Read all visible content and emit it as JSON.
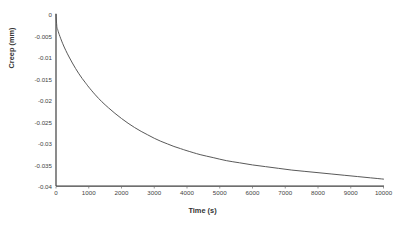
{
  "chart_data": {
    "type": "line",
    "title": "",
    "xlabel": "Time (s)",
    "ylabel": "Creep (mm)",
    "xlim": [
      0,
      10000
    ],
    "ylim": [
      -0.04,
      0
    ],
    "grid": false,
    "legend": false,
    "line_color": "#595959",
    "axis_color": "#3f3f3f",
    "xticks": [
      0,
      1000,
      2000,
      3000,
      4000,
      5000,
      6000,
      7000,
      8000,
      9000,
      10000
    ],
    "xtick_labels": [
      "0",
      "1000",
      "2000",
      "3000",
      "4000",
      "5000",
      "6000",
      "7000",
      "8000",
      "9000",
      "10000"
    ],
    "yticks": [
      0,
      -0.005,
      -0.01,
      -0.015,
      -0.02,
      -0.025,
      -0.03,
      -0.035,
      -0.04
    ],
    "ytick_labels": [
      "0",
      "-0.005",
      "-0.01",
      "-0.015",
      "-0.02",
      "-0.025",
      "-0.03",
      "-0.035",
      "-0.04"
    ],
    "series": [
      {
        "name": "Creep",
        "x": [
          0,
          25,
          50,
          100,
          200,
          300,
          400,
          500,
          600,
          700,
          800,
          900,
          1000,
          1200,
          1400,
          1600,
          1800,
          2000,
          2200,
          2400,
          2600,
          2800,
          3000,
          3200,
          3400,
          3600,
          3800,
          4000,
          4400,
          4800,
          5200,
          5600,
          6000,
          6400,
          6800,
          7200,
          7600,
          8000,
          8400,
          8800,
          9200,
          9600,
          10000
        ],
        "y": [
          0,
          -0.0029,
          -0.0036,
          -0.0048,
          -0.0068,
          -0.0085,
          -0.01,
          -0.0114,
          -0.0127,
          -0.0139,
          -0.015,
          -0.016,
          -0.017,
          -0.0188,
          -0.0204,
          -0.0218,
          -0.0231,
          -0.0243,
          -0.0254,
          -0.0264,
          -0.0273,
          -0.0281,
          -0.0289,
          -0.0296,
          -0.0302,
          -0.0308,
          -0.0313,
          -0.0318,
          -0.0327,
          -0.0334,
          -0.0341,
          -0.0346,
          -0.0351,
          -0.0355,
          -0.0359,
          -0.0363,
          -0.0366,
          -0.0369,
          -0.0372,
          -0.0375,
          -0.0378,
          -0.0381,
          -0.0384
        ]
      }
    ]
  }
}
